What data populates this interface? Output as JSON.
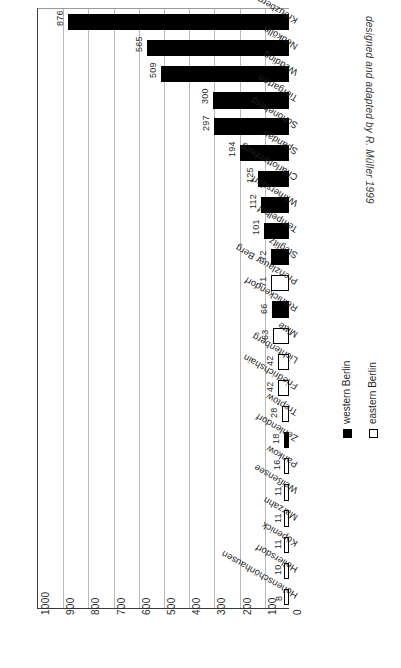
{
  "chart_data": {
    "type": "bar",
    "title": "",
    "subtitle": "",
    "orientation": "horizontal-rotated",
    "xlabel": "",
    "ylabel": "",
    "ylim": [
      0,
      1000
    ],
    "grid": true,
    "axis_ticks": [
      "1000",
      "900",
      "800",
      "700",
      "600",
      "500",
      "400",
      "300",
      "200",
      "100",
      "0"
    ],
    "axis_tick_values": [
      1000,
      900,
      800,
      700,
      600,
      500,
      400,
      300,
      200,
      100,
      0
    ],
    "categories": [
      "Kreuzberg",
      "Neukölln",
      "Wedding",
      "Tiergarten",
      "Schöneberg",
      "Spandau",
      "Charlottenburg",
      "Wilmersdorf",
      "Tempelhof",
      "Steglitz",
      "Prenzlauer Berg",
      "Reinickendorf",
      "Mitte",
      "Lichtenberg",
      "Friedrichshain",
      "Treptow",
      "Zehlendorf",
      "Pankow",
      "Weißensee",
      "Marzahn",
      "Köpenick",
      "Hellersdorf",
      "Hohenschönhausen"
    ],
    "values": [
      876,
      565,
      509,
      300,
      297,
      194,
      125,
      112,
      101,
      72,
      71,
      66,
      63,
      42,
      42,
      28,
      18,
      16,
      11,
      11,
      11,
      10,
      8
    ],
    "value_labels": [
      "876",
      "565",
      "509",
      "300",
      "297",
      "194",
      "125",
      "112",
      "101",
      "72",
      "71",
      "66",
      "63",
      "42",
      "42",
      "28",
      "18",
      "16",
      "11",
      "11",
      "11",
      "10",
      "8"
    ],
    "groups": [
      "western",
      "western",
      "western",
      "western",
      "western",
      "western",
      "western",
      "western",
      "western",
      "western",
      "eastern",
      "western",
      "eastern",
      "eastern",
      "eastern",
      "eastern",
      "western",
      "eastern",
      "eastern",
      "eastern",
      "eastern",
      "eastern",
      "eastern"
    ],
    "legend": {
      "position": "bottom-right",
      "entries": [
        {
          "key": "western",
          "label": "western Berlin",
          "color": "#000000"
        },
        {
          "key": "eastern",
          "label": "eastern Berlin",
          "color": "#ffffff"
        }
      ]
    },
    "annotations": [
      {
        "name": "credit",
        "text": "designed and adapted by R. Müller 1999"
      }
    ],
    "colors": {
      "western": "#000000",
      "eastern": "#ffffff",
      "bar_outline": "#000000",
      "gridline": "#b9b9b9",
      "axis": "#3a3a3a",
      "background": "#ffffff",
      "text": "#1f1f1f"
    }
  }
}
